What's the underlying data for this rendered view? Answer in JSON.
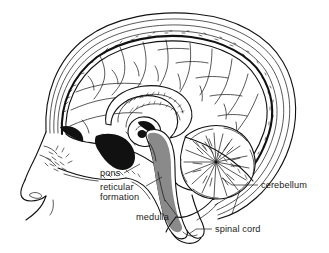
{
  "figure": {
    "type": "anatomical-line-diagram",
    "background_color": "#ffffff",
    "ink_color": "#111111",
    "shading_color": "#8a8a8a",
    "width": 329,
    "height": 253
  },
  "labels": [
    {
      "id": "pons",
      "text": "pons",
      "text_x": 100,
      "text_y": 176,
      "anchor": "start",
      "leader": "M 124 173 L 140 164",
      "side": "left"
    },
    {
      "id": "reticular-formation",
      "text_line1": "reticular",
      "text_line2": "formation",
      "text_x": 100,
      "text_y": 190,
      "line2_y": 200,
      "anchor": "start",
      "leader": "M 146 186 L 160 178",
      "side": "left"
    },
    {
      "id": "medulla",
      "text": "medulla",
      "text_x": 136,
      "text_y": 220,
      "anchor": "start",
      "leader": "M 178 217 L 164 200",
      "side": "left"
    },
    {
      "id": "cerebellum",
      "text": "cerebellum",
      "text_x": 261,
      "text_y": 188,
      "anchor": "start",
      "leader": "M 258 185 L 232 185",
      "side": "right"
    },
    {
      "id": "spinal-cord",
      "text": "spinal cord",
      "text_x": 215,
      "text_y": 232,
      "anchor": "start",
      "leader": "M 212 229 L 196 229",
      "side": "right"
    }
  ],
  "structures": [
    {
      "id": "scalp",
      "name": "scalp"
    },
    {
      "id": "skull",
      "name": "skull bone"
    },
    {
      "id": "dura",
      "name": "dura mater"
    },
    {
      "id": "cerebral-cortex",
      "name": "cerebral cortex"
    },
    {
      "id": "corpus-callosum",
      "name": "corpus callosum"
    },
    {
      "id": "brainstem",
      "name": "brainstem"
    },
    {
      "id": "reticular-formation",
      "name": "reticular formation"
    },
    {
      "id": "cerebellum",
      "name": "cerebellum"
    },
    {
      "id": "spinal-cord",
      "name": "spinal cord"
    },
    {
      "id": "face-profile",
      "name": "facial profile"
    },
    {
      "id": "sphenoid-sinus",
      "name": "sphenoid sinus"
    },
    {
      "id": "tentorium",
      "name": "tentorium cerebelli"
    }
  ]
}
